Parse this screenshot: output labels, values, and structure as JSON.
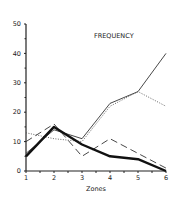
{
  "chart_data": {
    "type": "line",
    "title": "FREQUENCY",
    "xlabel": "Zones",
    "ylabel": "",
    "x": [
      1,
      2,
      3,
      4,
      5,
      6
    ],
    "ylim": [
      0,
      50
    ],
    "yticks": [
      0,
      10,
      20,
      30,
      40,
      50
    ],
    "grid": false,
    "legend": "none",
    "series": [
      {
        "name": "thin-solid",
        "style": "solid-thin",
        "values": [
          6,
          14,
          11,
          23,
          27,
          40
        ]
      },
      {
        "name": "dotted",
        "style": "dotted",
        "values": [
          13,
          11,
          10,
          22,
          27,
          22
        ]
      },
      {
        "name": "dashed",
        "style": "dashed",
        "values": [
          10,
          16,
          5,
          11,
          6,
          1
        ]
      },
      {
        "name": "thick-solid",
        "style": "solid-thick",
        "values": [
          5,
          15,
          9,
          5,
          4,
          0
        ]
      }
    ]
  }
}
